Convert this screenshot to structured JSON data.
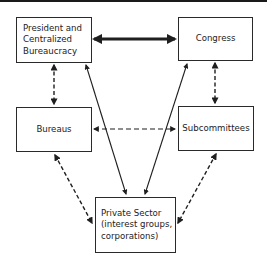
{
  "diagram": {
    "type": "relationship-diagram",
    "nodes": [
      {
        "id": "president",
        "label": "President and\nCentralized\nBureaucracy"
      },
      {
        "id": "congress",
        "label": "Congress"
      },
      {
        "id": "bureaus",
        "label": "Bureaus"
      },
      {
        "id": "subcommittees",
        "label": "Subcommittees"
      },
      {
        "id": "private",
        "label": "Private Sector\n(interest groups,\ncorporations)"
      }
    ],
    "edges": [
      {
        "from": "president",
        "to": "congress",
        "style": "thick-solid",
        "direction": "both"
      },
      {
        "from": "president",
        "to": "bureaus",
        "style": "dashed",
        "direction": "both"
      },
      {
        "from": "congress",
        "to": "subcommittees",
        "style": "dashed",
        "direction": "both"
      },
      {
        "from": "bureaus",
        "to": "subcommittees",
        "style": "dashed",
        "direction": "both"
      },
      {
        "from": "president",
        "to": "private",
        "style": "solid",
        "direction": "both"
      },
      {
        "from": "congress",
        "to": "private",
        "style": "solid",
        "direction": "both"
      },
      {
        "from": "bureaus",
        "to": "private",
        "style": "dashed",
        "direction": "both"
      },
      {
        "from": "subcommittees",
        "to": "private",
        "style": "dashed",
        "direction": "both"
      }
    ],
    "colors": {
      "line": "#1f1f1f",
      "background": "#ffffff"
    }
  }
}
